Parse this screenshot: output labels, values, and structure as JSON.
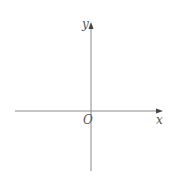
{
  "diagram": {
    "type": "cartesian-axes",
    "axes": {
      "x_label": "x",
      "y_label": "y",
      "origin_label": "O"
    },
    "colors": {
      "axis": "#8a8a8a",
      "text": "#555555",
      "background": "#ffffff"
    }
  }
}
